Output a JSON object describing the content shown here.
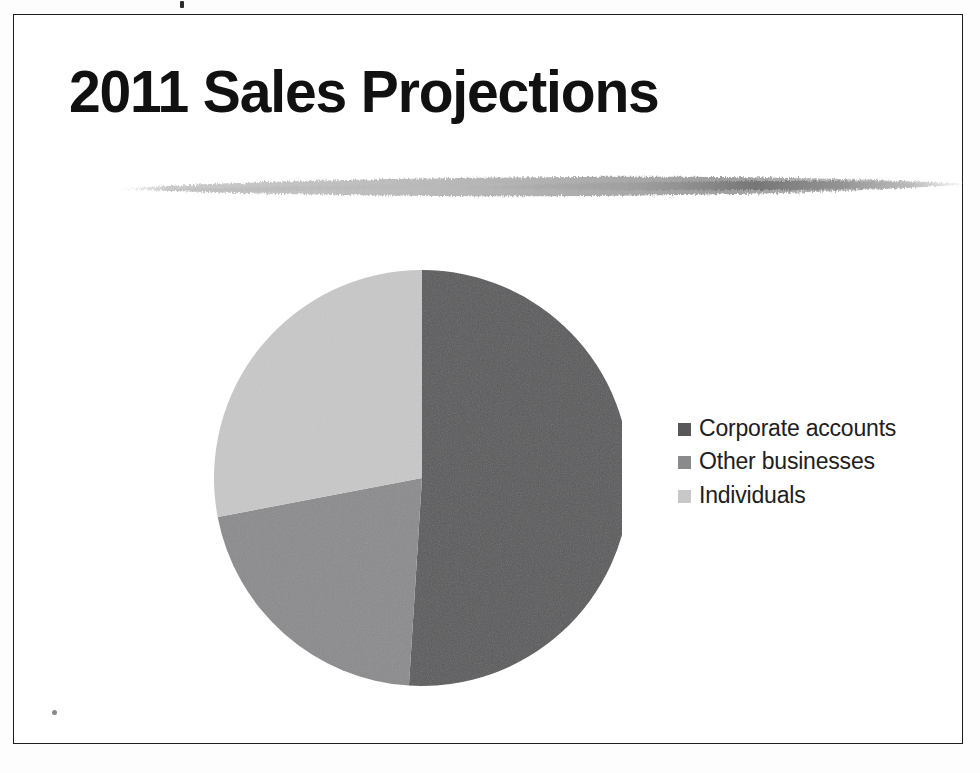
{
  "document": {
    "type": "scanned-presentation-slide",
    "ghost_text_top": "                                         ",
    "border_color": "#1d1d1d",
    "background_color": "#ffffff"
  },
  "slide": {
    "title": "2011 Sales Projections",
    "title_color": "#111111",
    "divider_name": "brush-stroke-divider",
    "divider_color": "#b4b4b4"
  },
  "chart_data": {
    "type": "pie",
    "title": "2011 Sales Projections",
    "subtitle": "",
    "xlabel": "",
    "ylabel": "",
    "legend_position": "right",
    "grid": false,
    "start_angle_deg": 0,
    "direction": "clockwise",
    "categories": [
      "Corporate accounts",
      "Other businesses",
      "Individuals"
    ],
    "values": [
      51,
      21,
      28
    ],
    "unit": "%",
    "colors": [
      "#58585a",
      "#8a8a8c",
      "#c8c8c8"
    ],
    "slices": [
      {
        "label": "Corporate accounts",
        "value": 51,
        "color": "#58585a",
        "start_angle_deg": 0,
        "end_angle_deg": 183.6
      },
      {
        "label": "Other businesses",
        "value": 21,
        "color": "#8a8a8c",
        "start_angle_deg": 183.6,
        "end_angle_deg": 259.2
      },
      {
        "label": "Individuals",
        "value": 28,
        "color": "#c8c8c8",
        "start_angle_deg": 259.2,
        "end_angle_deg": 360
      }
    ]
  },
  "legend": {
    "items": [
      {
        "label": "Corporate accounts",
        "color": "#58585a"
      },
      {
        "label": "Other businesses",
        "color": "#8a8a8c"
      },
      {
        "label": "Individuals",
        "color": "#c8c8c8"
      }
    ]
  }
}
